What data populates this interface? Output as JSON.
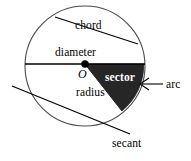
{
  "figure": {
    "background_color": "#ffffff",
    "stroke_color": "#000000",
    "sector_fill_color": "#262626",
    "label_color": "#000000",
    "label_on_dark_color": "#ffffff",
    "labels": {
      "chord": "chord",
      "diameter": "diameter",
      "center": "O",
      "sector": "sector",
      "radius": "radius",
      "arc": "arc",
      "secant": "secant"
    },
    "geometry": {
      "circle": {
        "cx": 85,
        "cy": 66,
        "r": 61
      },
      "center_point": {
        "cx": 85,
        "cy": 64,
        "r": 3.6
      },
      "diameter_line": {
        "x1": 24,
        "y1": 64,
        "x2": 146,
        "y2": 64
      },
      "chord_line": {
        "x1": 55,
        "y1": 17,
        "x2": 137,
        "y2": 43
      },
      "secant_line": {
        "x1": 12,
        "y1": 86,
        "x2": 130,
        "y2": 134
      },
      "sector": {
        "start_angle_deg": 0,
        "end_angle_deg": 52,
        "radius": 61
      },
      "arc_pointer": {
        "x1": 163,
        "y1": 84,
        "x2": 139,
        "y2": 84
      }
    }
  }
}
